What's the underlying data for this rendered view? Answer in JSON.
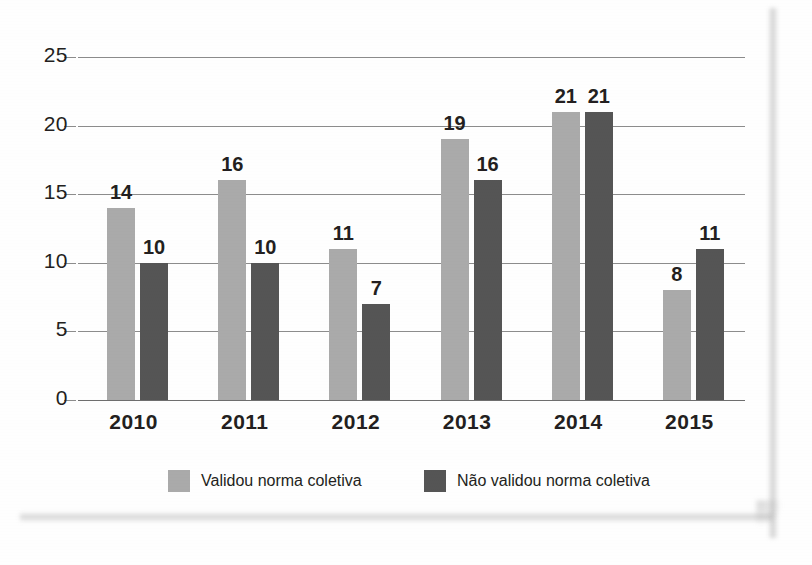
{
  "chart_data": {
    "type": "bar",
    "title": "",
    "xlabel": "",
    "ylabel": "",
    "categories": [
      "2010",
      "2011",
      "2012",
      "2013",
      "2014",
      "2015"
    ],
    "series": [
      {
        "name": "Validou norma coletiva",
        "color": "#aaaaaa",
        "values": [
          14,
          16,
          11,
          19,
          21,
          8
        ]
      },
      {
        "name": "Não validou norma coletiva",
        "color": "#555555",
        "values": [
          10,
          10,
          7,
          16,
          21,
          11
        ]
      }
    ],
    "ylim": [
      0,
      25
    ],
    "ytick_labels": [
      "0",
      "5",
      "10",
      "15",
      "20",
      "25"
    ],
    "ytick_values": [
      0,
      5,
      10,
      15,
      20,
      25
    ],
    "grid": true,
    "data_labels": true,
    "legend_position": "bottom"
  },
  "legend": {
    "items": [
      {
        "label": "Validou norma coletiva",
        "swatch": "light-gray-swatch"
      },
      {
        "label": "Não validou norma coletiva",
        "swatch": "dark-gray-swatch"
      }
    ]
  }
}
